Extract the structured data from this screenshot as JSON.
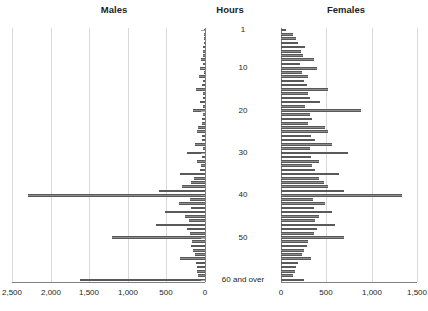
{
  "titles": {
    "males": "Males",
    "hours": "Hours",
    "females": "Females"
  },
  "axis": {
    "left_ticks": [
      "2,500",
      "2,000",
      "1,500",
      "1,000",
      "500",
      "0"
    ],
    "right_ticks": [
      "0",
      "500",
      "1,000",
      "1,500"
    ],
    "row_labels": [
      "1",
      "10",
      "20",
      "30",
      "40",
      "50",
      "60 and over"
    ]
  },
  "chart_data": {
    "type": "bar",
    "orientation": "horizontal-pyramid",
    "xlabel": "",
    "ylabel": "Hours",
    "categories": [
      1,
      2,
      3,
      4,
      5,
      6,
      7,
      8,
      9,
      10,
      11,
      12,
      13,
      14,
      15,
      16,
      17,
      18,
      19,
      20,
      21,
      22,
      23,
      24,
      25,
      26,
      27,
      28,
      29,
      30,
      31,
      32,
      33,
      34,
      35,
      36,
      37,
      38,
      39,
      40,
      41,
      42,
      43,
      44,
      45,
      46,
      47,
      48,
      49,
      50,
      51,
      52,
      53,
      54,
      55,
      56,
      57,
      58,
      59,
      60
    ],
    "category_labels_shown": [
      "1",
      "10",
      "20",
      "30",
      "40",
      "50",
      "60 and over"
    ],
    "left_axis_range": [
      0,
      2500
    ],
    "right_axis_range": [
      0,
      1500
    ],
    "left_axis_reversed": true,
    "grid": true,
    "legend": "none",
    "series": [
      {
        "name": "Males",
        "side": "left",
        "xlim": [
          0,
          2500
        ],
        "values": [
          10,
          12,
          14,
          16,
          30,
          22,
          24,
          55,
          20,
          70,
          18,
          80,
          22,
          36,
          120,
          30,
          32,
          60,
          22,
          150,
          28,
          40,
          34,
          95,
          110,
          36,
          44,
          130,
          30,
          230,
          40,
          100,
          55,
          70,
          320,
          145,
          180,
          300,
          590,
          2290,
          190,
          340,
          180,
          520,
          260,
          210,
          640,
          230,
          190,
          1210,
          170,
          180,
          150,
          130,
          320,
          120,
          110,
          105,
          95,
          1620
        ]
      },
      {
        "name": "Females",
        "side": "right",
        "xlim": [
          0,
          1500
        ],
        "values": [
          60,
          130,
          170,
          190,
          260,
          220,
          240,
          360,
          210,
          400,
          230,
          300,
          250,
          290,
          520,
          300,
          320,
          430,
          270,
          880,
          320,
          340,
          300,
          480,
          520,
          330,
          370,
          560,
          320,
          740,
          330,
          420,
          340,
          370,
          640,
          420,
          470,
          520,
          700,
          1340,
          350,
          490,
          360,
          560,
          420,
          380,
          600,
          400,
          360,
          700,
          300,
          290,
          250,
          230,
          330,
          190,
          170,
          150,
          130,
          250
        ]
      }
    ]
  }
}
